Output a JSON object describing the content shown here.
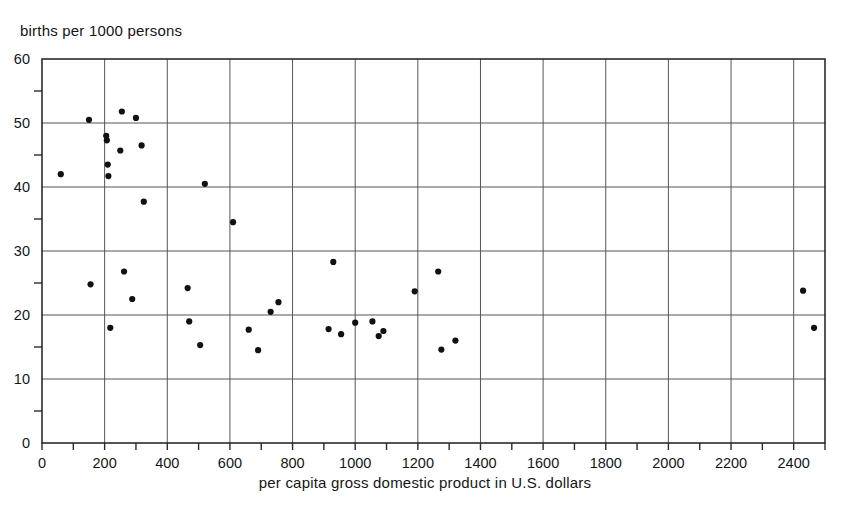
{
  "chart_data": {
    "type": "scatter",
    "title": "",
    "subtitle": "",
    "xlabel": "per capita gross domestic product in U.S. dollars",
    "ylabel": "births per 1000 persons",
    "xlim": [
      0,
      2500
    ],
    "ylim": [
      0,
      60
    ],
    "x_major_ticks": [
      0,
      200,
      400,
      600,
      800,
      1000,
      1200,
      1400,
      1600,
      1800,
      2000,
      2200,
      2400
    ],
    "x_minor_ticks": [
      100,
      300,
      500,
      700,
      900,
      1100,
      1300,
      1500,
      1700,
      1900,
      2100,
      2300,
      2500
    ],
    "x_tick_labels": [
      "0",
      "200",
      "400",
      "600",
      "800",
      "1000",
      "1200",
      "1400",
      "1600",
      "1800",
      "2000",
      "2200",
      "2400"
    ],
    "y_major_ticks": [
      0,
      10,
      20,
      30,
      40,
      50,
      60
    ],
    "y_minor_ticks": [
      5,
      15,
      25,
      35,
      45,
      55
    ],
    "y_tick_labels": [
      "0",
      "10",
      "20",
      "30",
      "40",
      "50",
      "60"
    ],
    "grid": "both",
    "grid_color": "#555555",
    "legend": "none",
    "marker": "filled-circle",
    "marker_color": "#111111",
    "marker_size_px": 5,
    "points": [
      {
        "x": 60,
        "y": 42.0
      },
      {
        "x": 150,
        "y": 50.5
      },
      {
        "x": 155,
        "y": 24.8
      },
      {
        "x": 205,
        "y": 48.0
      },
      {
        "x": 207,
        "y": 47.3
      },
      {
        "x": 210,
        "y": 43.5
      },
      {
        "x": 212,
        "y": 41.7
      },
      {
        "x": 218,
        "y": 18.0
      },
      {
        "x": 250,
        "y": 45.7
      },
      {
        "x": 255,
        "y": 51.8
      },
      {
        "x": 262,
        "y": 26.8
      },
      {
        "x": 288,
        "y": 22.5
      },
      {
        "x": 300,
        "y": 50.8
      },
      {
        "x": 318,
        "y": 46.5
      },
      {
        "x": 325,
        "y": 37.7
      },
      {
        "x": 465,
        "y": 24.2
      },
      {
        "x": 470,
        "y": 19.0
      },
      {
        "x": 505,
        "y": 15.3
      },
      {
        "x": 520,
        "y": 40.5
      },
      {
        "x": 610,
        "y": 34.5
      },
      {
        "x": 660,
        "y": 17.7
      },
      {
        "x": 690,
        "y": 14.5
      },
      {
        "x": 730,
        "y": 20.5
      },
      {
        "x": 755,
        "y": 22.0
      },
      {
        "x": 915,
        "y": 17.8
      },
      {
        "x": 930,
        "y": 28.3
      },
      {
        "x": 955,
        "y": 17.0
      },
      {
        "x": 1000,
        "y": 18.8
      },
      {
        "x": 1055,
        "y": 19.0
      },
      {
        "x": 1075,
        "y": 16.7
      },
      {
        "x": 1090,
        "y": 17.5
      },
      {
        "x": 1190,
        "y": 23.7
      },
      {
        "x": 1265,
        "y": 26.8
      },
      {
        "x": 1275,
        "y": 14.6
      },
      {
        "x": 1320,
        "y": 16.0
      },
      {
        "x": 2430,
        "y": 23.8
      },
      {
        "x": 2465,
        "y": 18.0
      }
    ]
  }
}
